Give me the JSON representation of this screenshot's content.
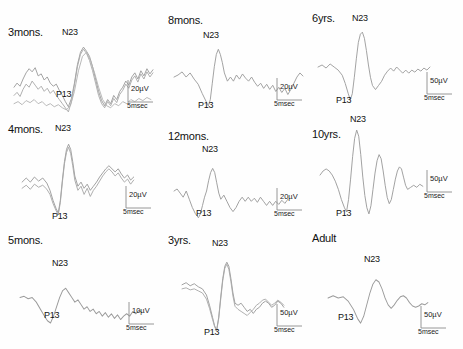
{
  "figure": {
    "background": "#ffffff",
    "trace_color": "#9a9a9a",
    "label_color": "#111111"
  },
  "peak_names": {
    "p13": "P13",
    "n23": "N23"
  },
  "panels": [
    {
      "id": "3mons",
      "age_label": "3mons.",
      "p13_label": "P13",
      "n23_label": "N23",
      "amplitude_scale": "20µV",
      "time_scale": "5msec",
      "trace_count": 3,
      "traces": [
        "M2,44 L5,40 L8,43 L11,36 L14,30 L17,26 L20,29 L23,25 L26,33 L29,31 L32,37 L35,34 L38,40 L41,43 L44,41 L47,47 L50,52 L53,58 L56,63 L59,55 L62,40 L65,22 L68,10 L71,5 L74,9 L77,14 L80,24 L83,36 L86,48 L89,57 L92,62 L95,56 L98,60 L101,52 L104,56 L107,48 L110,44 L113,38 L116,42 L119,34 L122,30 L125,36 L128,28 L131,33 L134,26 L137,31 L140,27",
        "M2,52 L5,49 L8,53 L11,46 L14,41 L17,44 L20,38 L23,42 L26,46 L29,43 L32,48 L35,45 L38,50 L41,47 L44,52 L47,56 L50,60 L53,64 L56,68 L59,58 L62,42 L65,24 L68,12 L71,7 L74,11 L77,18 L80,28 L83,40 L86,52 L89,60 L92,64 L95,58 L98,62 L101,55 L104,59 L107,51 L110,47 L113,41 L116,45 L119,37 L122,33 L125,39 L128,31 L131,36 L134,29 L137,34 L140,30",
        "M2,60 L6,58 L10,61 L14,57 L18,59 L22,56 L26,60 L30,58 L34,62 L38,60 L42,63 L46,61 L50,64 L54,66 L58,62 L62,48 L66,28 L70,14 L74,10 L78,18 L82,30 L86,44 L90,56 L94,62 L98,64 L102,60 L106,62 L110,58 L114,60 L118,56 L122,58 L126,55 L130,57 L134,54 L138,56"
      ],
      "trace_box": {
        "w": 145,
        "h": 72
      }
    },
    {
      "id": "8mons",
      "age_label": "8mons.",
      "p13_label": "P13",
      "n23_label": "N23",
      "amplitude_scale": "20µV",
      "time_scale": "5msec",
      "trace_count": 1,
      "traces": [
        "M2,38 L6,36 L10,33 L14,38 L18,34 L22,40 L26,45 L30,54 L34,62 L36,66 L38,60 L40,44 L42,28 L44,16 L46,11 L48,16 L50,24 L52,34 L55,42 L58,38 L61,42 L64,36 L67,40 L70,35 L73,39 L76,42 L79,38 L82,43 L85,47 L88,44 L91,49 L94,45 L97,50 L100,46 L103,52 L106,48 L109,53 L112,49 L115,55 L118,50 L121,44 L124,38 L127,34 L130,37"
      ],
      "trace_box": {
        "w": 135,
        "h": 72
      }
    },
    {
      "id": "6yrs",
      "age_label": "6yrs.",
      "p13_label": "P13",
      "n23_label": "N23",
      "amplitude_scale": "50µV",
      "time_scale": "5msec",
      "trace_count": 1,
      "traces": [
        "M2,40 L6,38 L10,41 L14,37 L18,40 L22,43 L26,48 L29,56 L32,66 L34,72 L36,66 L38,50 L40,32 L42,16 L44,8 L46,6 L48,12 L50,24 L52,38 L54,50 L56,58 L59,62 L62,58 L65,54 L68,48 L71,44 L74,41 L77,44 L80,40 L83,43 L86,46 L89,43 L92,46 L95,43 L98,45 L101,42 L104,44 L107,41 L110,43 L113,40"
      ],
      "trace_box": {
        "w": 118,
        "h": 78
      }
    },
    {
      "id": "4mons",
      "age_label": "4mons.",
      "p13_label": "P13",
      "n23_label": "N23",
      "amplitude_scale": "20µV",
      "time_scale": "5msec",
      "trace_count": 2,
      "traces": [
        "M2,46 L6,42 L10,46 L14,41 L18,45 L22,42 L26,47 L29,54 L32,64 L35,72 L37,76 L39,64 L41,44 L43,26 L45,14 L47,9 L49,14 L51,26 L53,40 L56,50 L59,46 L62,52 L65,48 L68,54 L71,50 L74,46 L77,41 L80,37 L83,33 L86,30 L89,33 L92,36 L95,33 L98,38 L101,42 L104,39 L107,44 L110,41",
        "M2,52 L6,49 L10,53 L14,48 L18,51 L22,49 L26,53 L29,58 L32,67 L35,74 L37,78 L39,66 L41,46 L43,28 L45,17 L47,12 L49,18 L51,30 L53,44 L56,54 L59,50 L62,58 L65,52 L68,60 L71,54 L74,50 L77,45 L80,40 L83,36 L86,33 L89,36 L92,40 L95,37 L98,42 L101,46 L104,43 L107,48 L110,44"
      ],
      "trace_box": {
        "w": 118,
        "h": 82
      }
    },
    {
      "id": "12mons",
      "age_label": "12mons.",
      "p13_label": "P13",
      "n23_label": "N23",
      "amplitude_scale": "20µV",
      "time_scale": "5msec",
      "trace_count": 1,
      "traces": [
        "M2,36 L5,34 L8,38 L11,42 L14,36 L17,44 L20,52 L23,58 L26,62 L28,58 L30,50 L32,42 L34,36 L36,26 L38,18 L40,14 L42,18 L44,28 L46,38 L48,44 L51,40 L54,46 L57,52 L60,56 L63,52 L66,46 L69,42 L72,46 L75,42 L78,46 L81,43 L84,47 L87,42 L90,46 L93,50 L96,46 L99,50 L102,46 L105,49 L108,45 L111,48 L114,44"
      ],
      "trace_box": {
        "w": 120,
        "h": 70
      }
    },
    {
      "id": "10yrs",
      "age_label": "10yrs.",
      "p13_label": "P13",
      "n23_label": "N23",
      "amplitude_scale": "50µV",
      "time_scale": "5msec",
      "trace_count": 1,
      "traces": [
        "M2,48 L5,44 L8,42 L11,44 L14,48 L17,54 L20,62 L23,72 L26,80 L28,84 L30,72 L32,52 L34,30 L36,12 L38,4 L40,10 L42,28 L44,50 L46,68 L48,80 L50,86 L52,78 L54,62 L56,46 L58,34 L60,28 L62,32 L64,44 L66,58 L68,70 L70,76 L72,72 L74,62 L76,52 L78,44 L80,40 L82,42 L84,50 L86,58 L88,62 L91,60 L94,58 L97,60 L100,57 L103,59"
      ],
      "trace_box": {
        "w": 110,
        "h": 90
      }
    },
    {
      "id": "5mons",
      "age_label": "5mons.",
      "p13_label": "P13",
      "n23_label": "N23",
      "amplitude_scale": "10µV",
      "time_scale": "5msec",
      "trace_count": 1,
      "traces": [
        "M2,22 L6,21 L10,23 L14,22 L18,26 L22,32 L26,38 L29,42 L32,44 L35,38 L38,30 L41,22 L44,16 L47,14 L50,18 L53,22 L56,26 L59,24 L62,28 L65,32 L68,30 L71,34 L74,32 L77,36 L80,34 L83,38 L86,35 L89,39 L92,36 L95,40 L98,37 L101,41 L104,38 L107,36 L110,38 L113,34 L116,36 L119,33 L122,35"
      ],
      "trace_box": {
        "w": 128,
        "h": 50
      }
    },
    {
      "id": "3yrs",
      "age_label": "3yrs.",
      "p13_label": "P13",
      "n23_label": "N23",
      "amplitude_scale": "50µV",
      "time_scale": "5msec",
      "trace_count": 2,
      "traces": [
        "M2,30 L6,28 L10,31 L14,29 L18,32 L22,34 L26,40 L29,50 L32,62 L34,70 L36,74 L38,62 L40,42 L42,24 L44,12 L46,8 L48,12 L50,24 L52,38 L54,48 L57,50 L60,48 L63,52 L66,56 L69,54 L72,58 L75,54 L78,52 L81,48 L84,46 L87,48 L90,52 L93,50 L96,46 L99,48 L102,52",
        "M2,34 L6,33 L10,35 L14,34 L18,36 L22,38 L26,44 L29,53 L32,64 L34,71 L36,75 L38,63 L40,44 L42,26 L44,14 L46,10 L48,15 L50,27 L52,41 L54,51 L57,54 L60,56 L63,58 L66,60 L69,57 L72,54 L75,50 L78,48 L81,45 L84,44 L87,47 L90,50 L93,48 L96,45 L99,47 L102,50"
      ],
      "trace_box": {
        "w": 110,
        "h": 80
      }
    },
    {
      "id": "adult",
      "age_label": "Adult",
      "p13_label": "P13",
      "n23_label": "N23",
      "amplitude_scale": "50µV",
      "time_scale": "5msec",
      "trace_count": 1,
      "traces": [
        "M2,28 L7,26 L12,28 L17,27 L22,31 L27,38 L31,46 L34,50 L37,44 L40,34 L43,24 L46,16 L49,12 L52,14 L55,20 L58,28 L61,34 L64,37 L67,34 L70,30 L73,27 L76,26 L79,28 L82,32 L85,35 L88,36 L91,35 L94,33 L97,34 L100,32"
      ],
      "trace_box": {
        "w": 108,
        "h": 56
      }
    }
  ]
}
